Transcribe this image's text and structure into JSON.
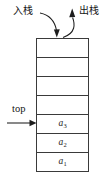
{
  "diagram": {
    "title_semantic": "stack-push-pop-diagram",
    "canvas": {
      "width": 108,
      "height": 182,
      "background": "#ffffff"
    },
    "line_color": "#1d1d1d",
    "text_color": "#151515"
  },
  "labels": {
    "push": "入栈",
    "pop": "出栈",
    "top": "top"
  },
  "stack": {
    "total_cells": 7,
    "cells": [
      {
        "value": "",
        "sub": "",
        "filled": false
      },
      {
        "value": "",
        "sub": "",
        "filled": false
      },
      {
        "value": "",
        "sub": "",
        "filled": false
      },
      {
        "value": "",
        "sub": "",
        "filled": false
      },
      {
        "value": "a",
        "sub": "3",
        "filled": true
      },
      {
        "value": "a",
        "sub": "2",
        "filled": true
      },
      {
        "value": "a",
        "sub": "1",
        "filled": true
      }
    ]
  },
  "arrows": {
    "push_arrow": {
      "from": "入栈 label",
      "to": "top of stack",
      "direction": "down",
      "style": "curved"
    },
    "pop_arrow": {
      "from": "top of stack",
      "to": "出栈 label",
      "direction": "up",
      "style": "curved"
    },
    "top_arrow": {
      "from": "top label",
      "to": "cell a3",
      "direction": "right",
      "style": "straight"
    }
  }
}
